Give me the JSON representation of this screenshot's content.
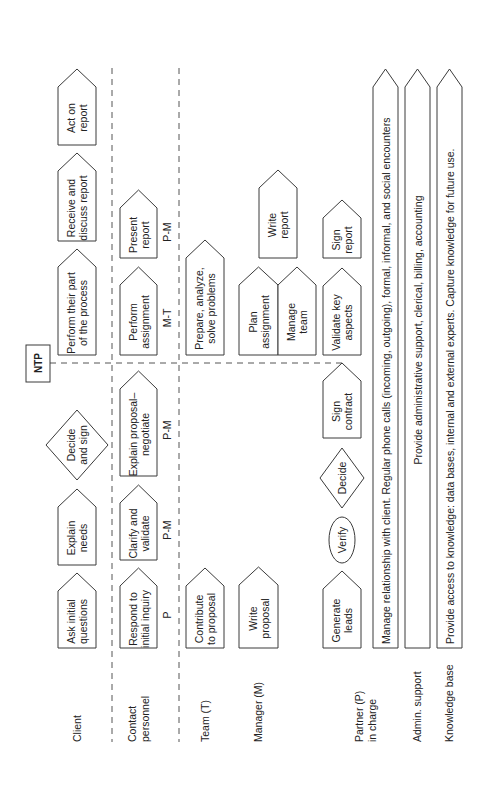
{
  "diagram": {
    "ntp_label": "NTP",
    "lanes": [
      {
        "id": "client",
        "lines": [
          "Client"
        ]
      },
      {
        "id": "contact",
        "lines": [
          "Contact",
          "personnel"
        ]
      },
      {
        "id": "team",
        "lines": [
          "Team (T)"
        ]
      },
      {
        "id": "manager",
        "lines": [
          "Manager (M)"
        ]
      },
      {
        "id": "partner",
        "lines": [
          "Partner (P)",
          "in charge"
        ]
      },
      {
        "id": "admin",
        "lines": [
          "Admin. support"
        ]
      },
      {
        "id": "knowledge",
        "lines": [
          "Knowledge base"
        ]
      }
    ],
    "steps": {
      "client": [
        {
          "lines": [
            "Ask initial",
            "questions"
          ],
          "shape": "pentagon"
        },
        {
          "lines": [
            "Explain",
            "needs"
          ],
          "shape": "pentagon"
        },
        {
          "lines": [
            "Decide",
            "and sign"
          ],
          "shape": "diamond"
        },
        {
          "lines": [
            "Perform their part",
            "of the process"
          ],
          "shape": "pentagon"
        },
        {
          "lines": [
            "Receive and",
            "discuss report"
          ],
          "shape": "pentagon"
        },
        {
          "lines": [
            "Act on",
            "report"
          ],
          "shape": "pentagon"
        }
      ],
      "contact": [
        {
          "lines": [
            "Respond to",
            "initial inquiry"
          ],
          "shape": "pentagon",
          "annotation": "P"
        },
        {
          "lines": [
            "Clarify and",
            "validate"
          ],
          "shape": "pentagon",
          "annotation": "P-M"
        },
        {
          "lines": [
            "Explain proposal–",
            "negotiate"
          ],
          "shape": "pentagon",
          "annotation": "P-M"
        },
        {
          "lines": [
            "Perform",
            "assignment"
          ],
          "shape": "pentagon",
          "annotation": "M-T"
        },
        {
          "lines": [
            "Present",
            "report"
          ],
          "shape": "pentagon",
          "annotation": "P-M"
        }
      ],
      "team": [
        {
          "lines": [
            "Contribute",
            "to proposal"
          ],
          "shape": "pentagon"
        },
        {
          "lines": [
            "Prepare, analyze,",
            "solve problems"
          ],
          "shape": "pentagon"
        }
      ],
      "manager": [
        {
          "lines": [
            "Write",
            "proposal"
          ],
          "shape": "pentagon"
        },
        {
          "lines": [
            "Plan",
            "assignment"
          ],
          "shape": "pentagon"
        },
        {
          "lines": [
            "Manage",
            "team"
          ],
          "shape": "pentagon"
        },
        {
          "lines": [
            "Write",
            "report"
          ],
          "shape": "pentagon"
        }
      ],
      "partner": [
        {
          "lines": [
            "Generate",
            "leads"
          ],
          "shape": "pentagon"
        },
        {
          "lines": [
            "Verify"
          ],
          "shape": "ellipse"
        },
        {
          "lines": [
            "Decide"
          ],
          "shape": "diamond"
        },
        {
          "lines": [
            "Sign",
            "contract"
          ],
          "shape": "pentagon"
        },
        {
          "lines": [
            "Validate key",
            "aspects"
          ],
          "shape": "pentagon"
        },
        {
          "lines": [
            "Sign",
            "report"
          ],
          "shape": "pentagon"
        }
      ]
    },
    "bands": [
      {
        "id": "relationship",
        "text": "Manage relationship with client. Regular phone calls (incoming, outgoing), formal, informal, and social encounters"
      },
      {
        "id": "admin",
        "text": "Provide administrative support, clerical, billing, accounting"
      },
      {
        "id": "knowledge",
        "text": "Provide access to knowledge: data bases, internal and external experts. Capture knowledge for future use."
      }
    ]
  }
}
